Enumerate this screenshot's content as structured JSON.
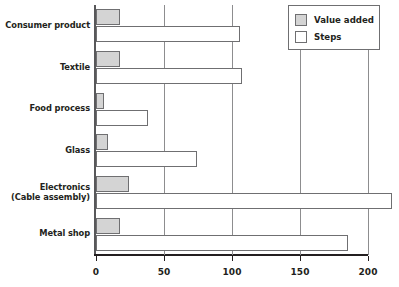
{
  "chart_data": {
    "type": "bar",
    "orientation": "horizontal",
    "title": "",
    "xlabel": "",
    "ylabel": "",
    "xlim": [
      0,
      200
    ],
    "xticks": [
      0,
      50,
      100,
      150,
      200
    ],
    "grid": "vertical",
    "legend_position": "top-right",
    "categories": [
      "Consumer product",
      "Textile",
      "Food process",
      "Glass",
      "Electronics\n(Cable assembly)",
      "Metal shop"
    ],
    "category_lines": [
      [
        "Consumer product"
      ],
      [
        "Textile"
      ],
      [
        "Food process"
      ],
      [
        "Glass"
      ],
      [
        "Electronics",
        "(Cable assembly)"
      ],
      [
        "Metal shop"
      ]
    ],
    "series": [
      {
        "name": "Value added",
        "color": "#d4d4d4",
        "values": [
          18,
          18,
          6,
          9,
          24,
          18
        ]
      },
      {
        "name": "Steps",
        "color": "#ffffff",
        "values": [
          106,
          107,
          38,
          74,
          218,
          185
        ]
      }
    ]
  },
  "legend": {
    "items": [
      {
        "label": "Value added",
        "swatch": "value-added"
      },
      {
        "label": "Steps",
        "swatch": "steps"
      }
    ]
  },
  "axis": {
    "tick_labels": [
      "0",
      "50",
      "100",
      "150",
      "200"
    ]
  }
}
